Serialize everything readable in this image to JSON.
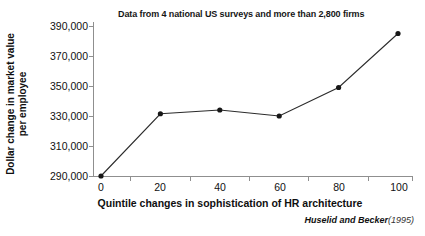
{
  "chart_data": {
    "type": "line",
    "title": "Data from 4 national US surveys and more than 2,800 firms",
    "xlabel": "Quintile changes in sophistication of HR architecture",
    "ylabel": "Dollar change in market value per employee",
    "ylabel_line1": "Dollar change in market value",
    "ylabel_line2": "per employee",
    "source": "Huselid and Becker",
    "source_year": "(1995)",
    "x": [
      0,
      20,
      40,
      60,
      80,
      100
    ],
    "values": [
      290000,
      331500,
      334000,
      330000,
      349000,
      385000
    ],
    "xlim": [
      -6,
      106
    ],
    "ylim": [
      290000,
      390000
    ],
    "xticklabels": [
      "0",
      "20",
      "40",
      "60",
      "80",
      "100"
    ],
    "yticklabels": [
      "290,000",
      "310,000",
      "330,000",
      "350,000",
      "370,000",
      "390,000"
    ],
    "ytickvalues": [
      290000,
      310000,
      330000,
      350000,
      370000,
      390000
    ],
    "grid": false,
    "legend": false,
    "marker": "filled-circle",
    "line_color": "#2b2b2b",
    "marker_color": "#171717",
    "axis_color": "#8f8f8f",
    "background": "#ffffff"
  }
}
